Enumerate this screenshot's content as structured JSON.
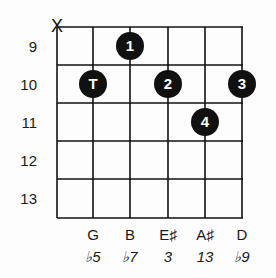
{
  "diagram": {
    "type": "guitar-chord",
    "fret_labels": [
      "9",
      "10",
      "11",
      "12",
      "13"
    ],
    "muted_string_marker": "X",
    "strings": [
      {
        "index": 0,
        "muted": true,
        "note": "",
        "interval": ""
      },
      {
        "index": 1,
        "note": "G",
        "interval": "♭5"
      },
      {
        "index": 2,
        "note": "B",
        "interval": "♭7"
      },
      {
        "index": 3,
        "note": "E♯",
        "interval": "3"
      },
      {
        "index": 4,
        "note": "A♯",
        "interval": "13"
      },
      {
        "index": 5,
        "note": "D",
        "interval": "♭9"
      }
    ],
    "fingers": [
      {
        "string": 1,
        "fret": 10,
        "label": "T"
      },
      {
        "string": 2,
        "fret": 9,
        "label": "1"
      },
      {
        "string": 3,
        "fret": 10,
        "label": "2"
      },
      {
        "string": 5,
        "fret": 10,
        "label": "3"
      },
      {
        "string": 4,
        "fret": 11,
        "label": "4"
      }
    ]
  }
}
